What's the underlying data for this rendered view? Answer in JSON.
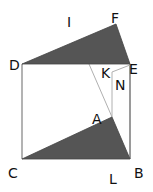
{
  "diagram": {
    "type": "geometry",
    "points": {
      "D": {
        "label": "D",
        "x": 22,
        "y": 64
      },
      "E": {
        "label": "E",
        "x": 130,
        "y": 64
      },
      "F": {
        "label": "F",
        "x": 116,
        "y": 24
      },
      "C": {
        "label": "C",
        "x": 22,
        "y": 159
      },
      "B": {
        "label": "B",
        "x": 130,
        "y": 159
      },
      "A": {
        "label": "A",
        "x": 112,
        "y": 117
      },
      "K": {
        "label": "K",
        "x": 112,
        "y": 72
      }
    },
    "labels": {
      "I": "I",
      "F": "F",
      "D": "D",
      "K": "K",
      "E": "E",
      "N": "N",
      "A": "A",
      "C": "C",
      "B": "B",
      "L": "L"
    },
    "shaded_triangles": [
      "DFE",
      "CAB"
    ],
    "colors": {
      "fill": "#555555",
      "square_edge": "#9a9a9a",
      "thin_line": "#b0b0b0",
      "label": "#111111"
    }
  }
}
